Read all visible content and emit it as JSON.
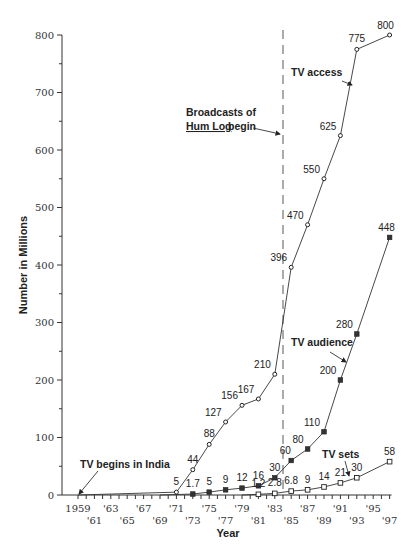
{
  "chart_data": {
    "type": "line",
    "title": "",
    "xlabel": "Year",
    "ylabel": "Number in Millions",
    "ylim": [
      0,
      800
    ],
    "xlim": [
      1959,
      1997
    ],
    "y_ticks": [
      0,
      100,
      200,
      300,
      400,
      500,
      600,
      700,
      800
    ],
    "y_minor_step": 50,
    "x_tick_labels": [
      {
        "year": 1959,
        "label": "1959",
        "row": 0
      },
      {
        "year": 1961,
        "label": "'61",
        "row": 1
      },
      {
        "year": 1963,
        "label": "'63",
        "row": 0
      },
      {
        "year": 1965,
        "label": "'65",
        "row": 1
      },
      {
        "year": 1967,
        "label": "'67",
        "row": 0
      },
      {
        "year": 1969,
        "label": "'69",
        "row": 1
      },
      {
        "year": 1971,
        "label": "'71",
        "row": 0
      },
      {
        "year": 1973,
        "label": "'73",
        "row": 1
      },
      {
        "year": 1975,
        "label": "'75",
        "row": 0
      },
      {
        "year": 1977,
        "label": "'77",
        "row": 1
      },
      {
        "year": 1979,
        "label": "'79",
        "row": 0
      },
      {
        "year": 1981,
        "label": "'81",
        "row": 1
      },
      {
        "year": 1983,
        "label": "'83",
        "row": 0
      },
      {
        "year": 1985,
        "label": "'85",
        "row": 1
      },
      {
        "year": 1987,
        "label": "'87",
        "row": 0
      },
      {
        "year": 1989,
        "label": "'89",
        "row": 1
      },
      {
        "year": 1991,
        "label": "'91",
        "row": 0
      },
      {
        "year": 1993,
        "label": "'93",
        "row": 1
      },
      {
        "year": 1995,
        "label": "'95",
        "row": 0
      },
      {
        "year": 1997,
        "label": "'97",
        "row": 1
      }
    ],
    "series": [
      {
        "name": "TV access",
        "marker": "open-circle",
        "x": [
          1959,
          1971,
          1973,
          1975,
          1977,
          1979,
          1981,
          1983,
          1985,
          1987,
          1989,
          1991,
          1993,
          1997
        ],
        "values": [
          0,
          5,
          44,
          88,
          127,
          156,
          167,
          210,
          396,
          470,
          550,
          625,
          775,
          800
        ],
        "labels": [
          "",
          "5",
          "44",
          "88",
          "127",
          "156",
          "167",
          "210",
          "396",
          "470",
          "550",
          "625",
          "775",
          "800"
        ]
      },
      {
        "name": "TV audience",
        "marker": "filled-square",
        "x": [
          1969,
          1973,
          1975,
          1977,
          1979,
          1981,
          1983,
          1985,
          1987,
          1989,
          1991,
          1993,
          1997
        ],
        "values": [
          0,
          1.7,
          5,
          9,
          12,
          16,
          30,
          60,
          80,
          110,
          200,
          280,
          448
        ],
        "labels": [
          "",
          "1.7",
          "5",
          "9",
          "12",
          "16",
          "30",
          "60",
          "80",
          "110",
          "200",
          "280",
          "448"
        ]
      },
      {
        "name": "TV sets",
        "marker": "open-square",
        "x": [
          1979,
          1981,
          1983,
          1985,
          1987,
          1989,
          1991,
          1993,
          1997
        ],
        "values": [
          0,
          1.2,
          2.8,
          6.8,
          9,
          14,
          21,
          30,
          58
        ],
        "labels": [
          "",
          "1.2",
          "2.8",
          "6.8",
          "9",
          "14",
          "21",
          "30",
          "58"
        ]
      }
    ],
    "annotations": [
      {
        "text": "TV begins in India",
        "x": 80,
        "y": 468,
        "arrow": [
          98,
          471,
          79,
          494
        ]
      },
      {
        "text": "TV access",
        "x": 291,
        "y": 76,
        "arrow": [
          342,
          81,
          352,
          85
        ]
      },
      {
        "text": "TV audience",
        "x": 291,
        "y": 346,
        "arrow": [
          330,
          352,
          346,
          362
        ]
      },
      {
        "text": "TV sets",
        "x": 322,
        "y": 458,
        "arrow": [
          345,
          461,
          349,
          476
        ]
      }
    ],
    "event_line": {
      "year": 1984,
      "label_line1": "Broadcasts of",
      "label_line2_underlined": "Hum Log",
      "label_line2_rest": "begin"
    }
  }
}
